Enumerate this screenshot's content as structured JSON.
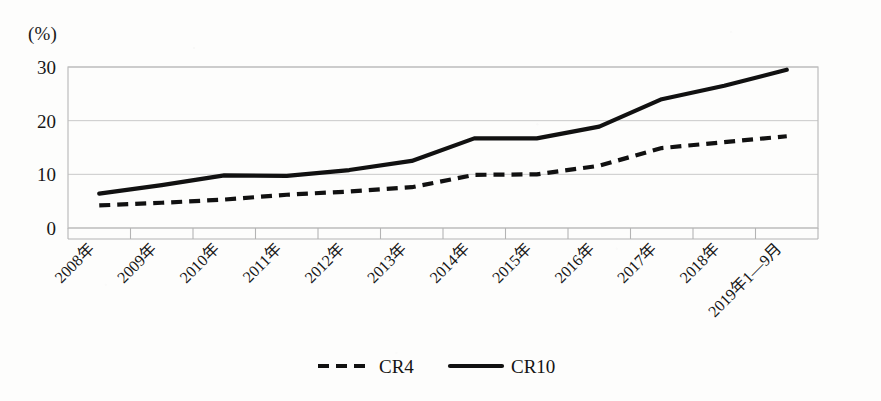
{
  "axis_unit_label": "(%)",
  "legend": {
    "items": [
      {
        "name": "cr4",
        "label": "CR4",
        "style": "dashed"
      },
      {
        "name": "cr10",
        "label": "CR10",
        "style": "solid"
      }
    ]
  },
  "colors": {
    "ink": "#111111",
    "grid": "#c9c9c9",
    "frame": "#bdbdbd",
    "paper": "#fdfdfc"
  },
  "chart_data": {
    "type": "line",
    "title": "",
    "xlabel": "",
    "ylabel": "(%)",
    "ylim": [
      0,
      30
    ],
    "yticks": [
      0,
      10,
      20,
      30
    ],
    "grid": true,
    "legend_position": "bottom-center",
    "categories": [
      "2008年",
      "2009年",
      "2010年",
      "2011年",
      "2012年",
      "2013年",
      "2014年",
      "2015年",
      "2016年",
      "2017年",
      "2018年",
      "2019年1—9月"
    ],
    "series": [
      {
        "name": "CR4",
        "style": "dashed",
        "values": [
          4.2,
          4.7,
          5.3,
          6.2,
          6.8,
          7.6,
          9.9,
          10.0,
          11.6,
          14.9,
          16.0,
          17.1
        ]
      },
      {
        "name": "CR10",
        "style": "solid",
        "values": [
          6.4,
          8.0,
          9.8,
          9.7,
          10.8,
          12.5,
          16.7,
          16.7,
          18.9,
          24.0,
          26.5,
          29.5
        ]
      }
    ]
  }
}
